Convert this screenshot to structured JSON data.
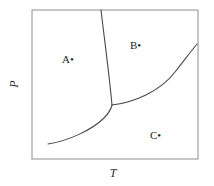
{
  "figure": {
    "type": "phase-diagram",
    "background_color": "#ffffff",
    "frame_color": "#8d8d8d",
    "curve_color": "#4a4a4a",
    "text_color": "#1d1d1d"
  },
  "axes": {
    "x_label": "T",
    "y_label": "P",
    "x_label_name": "temperature-axis-label",
    "y_label_name": "pressure-axis-label",
    "ticks": [],
    "grid": false
  },
  "regions": [
    {
      "label": "A",
      "marker": "•",
      "x": 75,
      "y": 60
    },
    {
      "label": "B",
      "marker": "•",
      "x": 143,
      "y": 46
    },
    {
      "label": "C",
      "marker": "•",
      "x": 163,
      "y": 136
    }
  ],
  "chart_data": {
    "type": "line",
    "title": "",
    "xlabel": "T",
    "ylabel": "P",
    "grid": false,
    "legend": "none",
    "frame": {
      "left": 32,
      "top": 10,
      "right": 198,
      "bottom": 159
    },
    "triple_point": {
      "x": 112,
      "y": 105
    },
    "series": [
      {
        "name": "fusion-curve",
        "path": "M 101 10 C 104 36, 109 72, 112 105"
      },
      {
        "name": "vaporization-curve",
        "path": "M 112 105 C 132 103, 160 92, 175 72 C 186 58, 192 50, 197 44"
      },
      {
        "name": "sublimation-curve",
        "path": "M 48 144 C 68 141, 92 130, 104 118 C 109 113, 111 109, 112 105"
      }
    ]
  }
}
